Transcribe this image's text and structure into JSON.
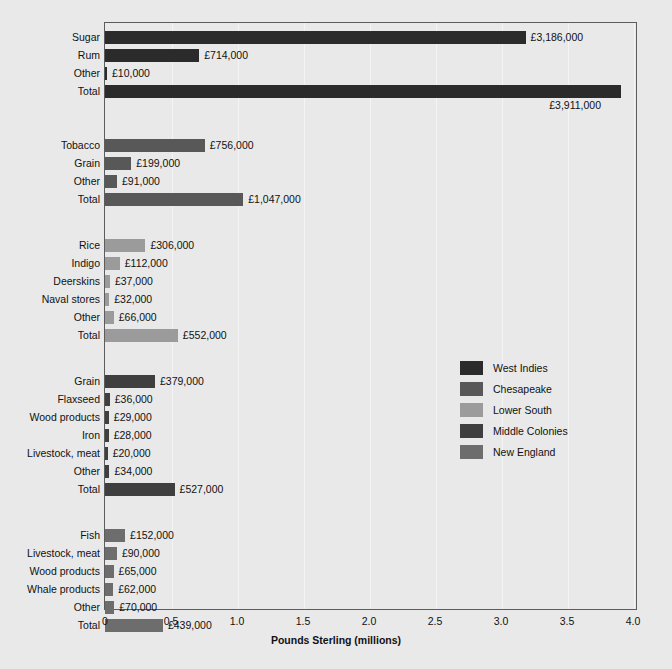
{
  "chart_data": {
    "type": "bar",
    "orientation": "horizontal",
    "title": "",
    "xlabel": "Pounds Sterling (millions)",
    "ylabel": "",
    "xlim": [
      0,
      4.0
    ],
    "xticks": [
      0,
      0.5,
      1.0,
      1.5,
      2.0,
      2.5,
      3.0,
      3.5,
      4.0
    ],
    "xticklabels": [
      "0",
      "0.5",
      "1.0",
      "1.5",
      "2.0",
      "2.5",
      "3.0",
      "3.5",
      "4.0"
    ],
    "grid": true,
    "legend_position": "center-right",
    "value_unit": "£",
    "legend": [
      {
        "name": "West Indies",
        "color": "#2b2b2b"
      },
      {
        "name": "Chesapeake",
        "color": "#585858"
      },
      {
        "name": "Lower South",
        "color": "#9b9b9b"
      },
      {
        "name": "Middle Colonies",
        "color": "#3f3f3f"
      },
      {
        "name": "New England",
        "color": "#6d6d6d"
      }
    ],
    "groups": [
      {
        "name": "West Indies",
        "color": "#2b2b2b",
        "bars": [
          {
            "label": "Sugar",
            "value": 3.186,
            "value_label": "£3,186,000"
          },
          {
            "label": "Rum",
            "value": 0.714,
            "value_label": "£714,000"
          },
          {
            "label": "Other",
            "value": 0.01,
            "value_label": "£10,000"
          },
          {
            "label": "Total",
            "value": 3.911,
            "value_label": "£3,911,000",
            "label_below": true
          }
        ]
      },
      {
        "name": "Chesapeake",
        "color": "#585858",
        "bars": [
          {
            "label": "Tobacco",
            "value": 0.756,
            "value_label": "£756,000"
          },
          {
            "label": "Grain",
            "value": 0.199,
            "value_label": "£199,000"
          },
          {
            "label": "Other",
            "value": 0.091,
            "value_label": "£91,000"
          },
          {
            "label": "Total",
            "value": 1.047,
            "value_label": "£1,047,000"
          }
        ]
      },
      {
        "name": "Lower South",
        "color": "#9b9b9b",
        "bars": [
          {
            "label": "Rice",
            "value": 0.306,
            "value_label": "£306,000"
          },
          {
            "label": "Indigo",
            "value": 0.112,
            "value_label": "£112,000"
          },
          {
            "label": "Deerskins",
            "value": 0.037,
            "value_label": "£37,000"
          },
          {
            "label": "Naval stores",
            "value": 0.032,
            "value_label": "£32,000"
          },
          {
            "label": "Other",
            "value": 0.066,
            "value_label": "£66,000"
          },
          {
            "label": "Total",
            "value": 0.552,
            "value_label": "£552,000"
          }
        ]
      },
      {
        "name": "Middle Colonies",
        "color": "#3f3f3f",
        "bars": [
          {
            "label": "Grain",
            "value": 0.379,
            "value_label": "£379,000"
          },
          {
            "label": "Flaxseed",
            "value": 0.036,
            "value_label": "£36,000"
          },
          {
            "label": "Wood products",
            "value": 0.029,
            "value_label": "£29,000"
          },
          {
            "label": "Iron",
            "value": 0.028,
            "value_label": "£28,000"
          },
          {
            "label": "Livestock, meat",
            "value": 0.02,
            "value_label": "£20,000"
          },
          {
            "label": "Other",
            "value": 0.034,
            "value_label": "£34,000"
          },
          {
            "label": "Total",
            "value": 0.527,
            "value_label": "£527,000"
          }
        ]
      },
      {
        "name": "New England",
        "color": "#6d6d6d",
        "bars": [
          {
            "label": "Fish",
            "value": 0.152,
            "value_label": "£152,000"
          },
          {
            "label": "Livestock, meat",
            "value": 0.09,
            "value_label": "£90,000"
          },
          {
            "label": "Wood products",
            "value": 0.065,
            "value_label": "£65,000"
          },
          {
            "label": "Whale products",
            "value": 0.062,
            "value_label": "£62,000"
          },
          {
            "label": "Other",
            "value": 0.07,
            "value_label": "£70,000"
          },
          {
            "label": "Total",
            "value": 0.439,
            "value_label": "£439,000"
          }
        ]
      }
    ]
  }
}
